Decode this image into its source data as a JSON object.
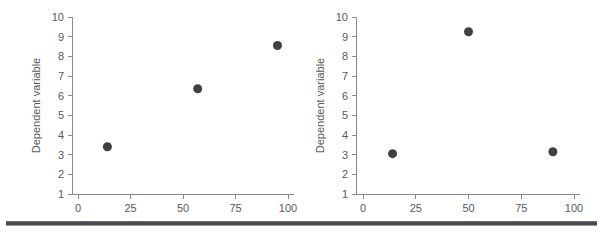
{
  "figure": {
    "background_color": "#ffffff",
    "marker_color": "#404042",
    "axis_color": "#8a8a8c",
    "text_color": "#58595b",
    "rule_color": "#4b4b4d"
  },
  "panels": [
    {
      "id": "left",
      "name": "left-scatter-panel"
    },
    {
      "id": "right",
      "name": "right-scatter-panel"
    }
  ],
  "chart_data": [
    {
      "type": "scatter",
      "title": "",
      "xlabel": "",
      "ylabel": "Dependent variable",
      "xlim": [
        0,
        105
      ],
      "ylim": [
        1,
        10
      ],
      "xticks": [
        0,
        25,
        50,
        75,
        100
      ],
      "xtick_labels": [
        "0",
        "25",
        "50",
        "75",
        "100"
      ],
      "yticks": [
        1,
        2,
        3,
        4,
        5,
        6,
        7,
        8,
        9,
        10
      ],
      "ytick_labels": [
        "1",
        "2",
        "3",
        "4",
        "5",
        "6",
        "7",
        "8",
        "9",
        "10"
      ],
      "grid": false,
      "legend": false,
      "marker_color": "#404042",
      "marker_size": 9,
      "points": [
        {
          "x": 14,
          "y": 3.4
        },
        {
          "x": 57,
          "y": 6.35
        },
        {
          "x": 95,
          "y": 8.55
        }
      ]
    },
    {
      "type": "scatter",
      "title": "",
      "xlabel": "",
      "ylabel": "Dependent variable",
      "xlim": [
        0,
        105
      ],
      "ylim": [
        1,
        10
      ],
      "xticks": [
        0,
        25,
        50,
        75,
        100
      ],
      "xtick_labels": [
        "0",
        "25",
        "50",
        "75",
        "100"
      ],
      "yticks": [
        1,
        2,
        3,
        4,
        5,
        6,
        7,
        8,
        9,
        10
      ],
      "ytick_labels": [
        "1",
        "2",
        "3",
        "4",
        "5",
        "6",
        "7",
        "8",
        "9",
        "10"
      ],
      "grid": false,
      "legend": false,
      "marker_color": "#404042",
      "marker_size": 9,
      "points": [
        {
          "x": 14,
          "y": 3.05
        },
        {
          "x": 50,
          "y": 9.25
        },
        {
          "x": 90,
          "y": 3.15
        }
      ]
    }
  ]
}
